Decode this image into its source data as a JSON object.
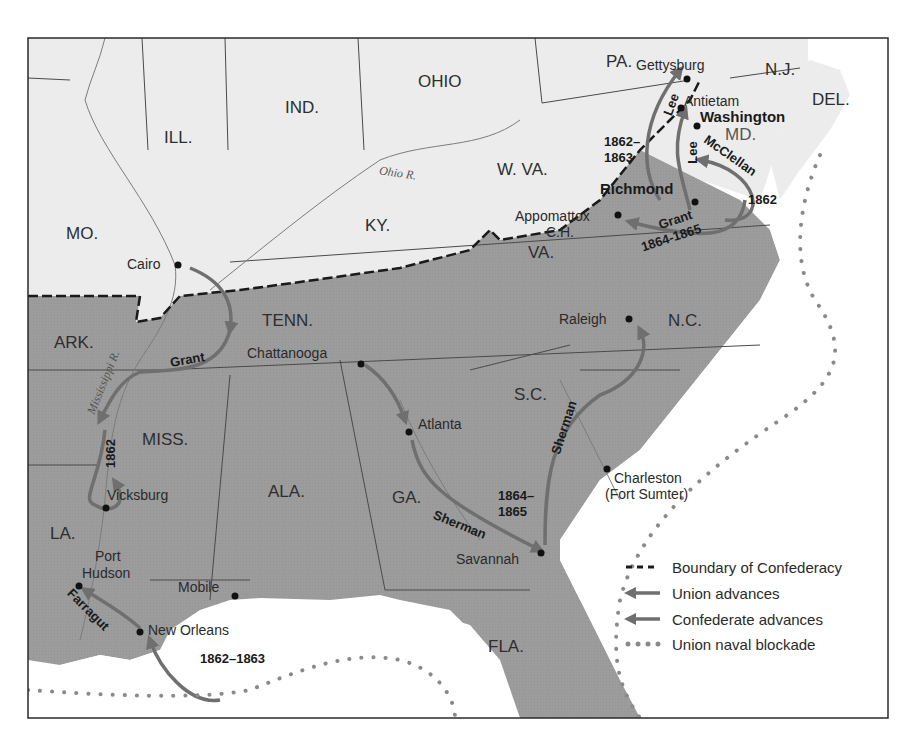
{
  "map": {
    "colors": {
      "confederacy_fill": "#9c9c9c",
      "union_fill": "#ececec",
      "water": "#ffffff",
      "arrow": "#6f6f6f",
      "border": "#2a2a2a",
      "blockade_dots": "#8a8a8a"
    },
    "states": [
      {
        "id": "ill",
        "label": "ILL."
      },
      {
        "id": "ind",
        "label": "IND."
      },
      {
        "id": "ohio",
        "label": "OHIO"
      },
      {
        "id": "pa",
        "label": "PA."
      },
      {
        "id": "nj",
        "label": "N.J."
      },
      {
        "id": "del",
        "label": "DEL."
      },
      {
        "id": "md",
        "label": "MD."
      },
      {
        "id": "wva",
        "label": "W. VA."
      },
      {
        "id": "mo",
        "label": "MO."
      },
      {
        "id": "ky",
        "label": "KY."
      },
      {
        "id": "va",
        "label": "VA."
      },
      {
        "id": "ark",
        "label": "ARK."
      },
      {
        "id": "tenn",
        "label": "TENN."
      },
      {
        "id": "nc",
        "label": "N.C."
      },
      {
        "id": "sc",
        "label": "S.C."
      },
      {
        "id": "miss",
        "label": "MISS."
      },
      {
        "id": "ala",
        "label": "ALA."
      },
      {
        "id": "ga",
        "label": "GA."
      },
      {
        "id": "la",
        "label": "LA."
      },
      {
        "id": "fla",
        "label": "FLA."
      }
    ],
    "cities": [
      {
        "id": "gettysburg",
        "label": "Gettysburg"
      },
      {
        "id": "antietam",
        "label": "Antietam"
      },
      {
        "id": "washington",
        "label": "Washington"
      },
      {
        "id": "richmond",
        "label": "Richmond"
      },
      {
        "id": "appomattox",
        "label": "Appomattox"
      },
      {
        "id": "appomattox_ch",
        "label": "C.H."
      },
      {
        "id": "cairo",
        "label": "Cairo"
      },
      {
        "id": "chattanooga",
        "label": "Chattanooga"
      },
      {
        "id": "raleigh",
        "label": "Raleigh"
      },
      {
        "id": "atlanta",
        "label": "Atlanta"
      },
      {
        "id": "charleston",
        "label": "Charleston"
      },
      {
        "id": "fort_sumter",
        "label": "(Fort Sumter)"
      },
      {
        "id": "vicksburg",
        "label": "Vicksburg"
      },
      {
        "id": "port",
        "label": "Port"
      },
      {
        "id": "hudson",
        "label": "Hudson"
      },
      {
        "id": "mobile",
        "label": "Mobile"
      },
      {
        "id": "savannah",
        "label": "Savannah"
      },
      {
        "id": "new_orleans",
        "label": "New Orleans"
      }
    ],
    "rivers": [
      {
        "id": "ohio_r",
        "label": "Ohio R."
      },
      {
        "id": "mississippi_r",
        "label": "Mississippi R."
      }
    ],
    "campaigns": [
      {
        "id": "lee1",
        "label": "Lee"
      },
      {
        "id": "lee2",
        "label": "Lee"
      },
      {
        "id": "lee_years_a",
        "label": "1862–"
      },
      {
        "id": "lee_years_b",
        "label": "1863"
      },
      {
        "id": "mcclellan",
        "label": "McClellan"
      },
      {
        "id": "mcclellan_year",
        "label": "1862"
      },
      {
        "id": "grant_va",
        "label": "Grant"
      },
      {
        "id": "grant_va_years",
        "label": "1864-1865"
      },
      {
        "id": "grant_west",
        "label": "Grant"
      },
      {
        "id": "grant_west_year",
        "label": "1862"
      },
      {
        "id": "sherman_ga",
        "label": "Sherman"
      },
      {
        "id": "sherman_carolinas",
        "label": "Sherman"
      },
      {
        "id": "sherman_years_a",
        "label": "1864–"
      },
      {
        "id": "sherman_years_b",
        "label": "1865"
      },
      {
        "id": "farragut",
        "label": "Farragut"
      },
      {
        "id": "farragut_years",
        "label": "1862–1863"
      }
    ],
    "legend": [
      {
        "id": "boundary",
        "symbol": "dashed-line",
        "label": "Boundary of Confederacy"
      },
      {
        "id": "union",
        "symbol": "arrow",
        "label": "Union advances"
      },
      {
        "id": "confederate",
        "symbol": "arrow",
        "label": "Confederate advances"
      },
      {
        "id": "blockade",
        "symbol": "dotted-line",
        "label": "Union naval blockade"
      }
    ]
  }
}
